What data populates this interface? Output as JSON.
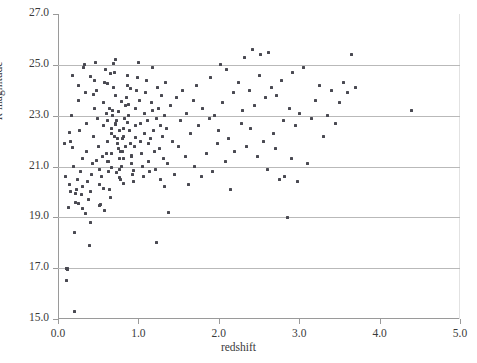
{
  "chart_data": {
    "type": "scatter",
    "title": "",
    "xlabel": "redshift",
    "ylabel": "R magnitude",
    "ylabel_italic_prefix": "R",
    "ylabel_rest": " magnitude",
    "xlim": [
      0.0,
      5.0
    ],
    "ylim": [
      15.0,
      27.0
    ],
    "xticks": [
      "0.0",
      "1.0",
      "2.0",
      "3.0",
      "4.0",
      "5.0"
    ],
    "xtick_values": [
      0.0,
      1.0,
      2.0,
      3.0,
      4.0,
      5.0
    ],
    "yticks": [
      "15.0",
      "17.0",
      "19.0",
      "21.0",
      "23.0",
      "25.0",
      "27.0"
    ],
    "ytick_values": [
      15.0,
      17.0,
      19.0,
      21.0,
      23.0,
      25.0,
      27.0
    ],
    "grid": "horizontal",
    "gridline_color": "#b9b9b9",
    "axis_color": "#9a9a9a",
    "marker_color": "#4a4a52",
    "marker_size_px": 3,
    "legend": null,
    "points": [
      [
        0.08,
        21.9
      ],
      [
        0.09,
        20.6
      ],
      [
        0.1,
        17.0
      ],
      [
        0.11,
        17.0
      ],
      [
        0.12,
        17.0
      ],
      [
        0.12,
        16.95
      ],
      [
        0.1,
        16.5
      ],
      [
        0.13,
        19.4
      ],
      [
        0.14,
        20.3
      ],
      [
        0.15,
        20.0
      ],
      [
        0.16,
        22.0
      ],
      [
        0.17,
        23.0
      ],
      [
        0.18,
        24.6
      ],
      [
        0.19,
        21.0
      ],
      [
        0.2,
        15.3
      ],
      [
        0.21,
        18.4
      ],
      [
        0.22,
        19.6
      ],
      [
        0.23,
        20.1
      ],
      [
        0.24,
        20.5
      ],
      [
        0.25,
        24.2
      ],
      [
        0.26,
        23.6
      ],
      [
        0.27,
        22.4
      ],
      [
        0.28,
        20.8
      ],
      [
        0.29,
        19.9
      ],
      [
        0.3,
        20.2
      ],
      [
        0.31,
        21.3
      ],
      [
        0.32,
        24.9
      ],
      [
        0.33,
        25.0
      ],
      [
        0.34,
        23.9
      ],
      [
        0.35,
        22.7
      ],
      [
        0.36,
        21.6
      ],
      [
        0.37,
        20.4
      ],
      [
        0.38,
        19.7
      ],
      [
        0.39,
        17.9
      ],
      [
        0.4,
        18.8
      ],
      [
        0.41,
        20.0
      ],
      [
        0.42,
        20.7
      ],
      [
        0.43,
        21.1
      ],
      [
        0.44,
        22.2
      ],
      [
        0.45,
        23.3
      ],
      [
        0.46,
        24.4
      ],
      [
        0.47,
        25.1
      ],
      [
        0.48,
        24.0
      ],
      [
        0.49,
        22.9
      ],
      [
        0.5,
        21.8
      ],
      [
        0.51,
        20.9
      ],
      [
        0.52,
        20.3
      ],
      [
        0.53,
        19.5
      ],
      [
        0.54,
        20.6
      ],
      [
        0.55,
        21.4
      ],
      [
        0.56,
        22.6
      ],
      [
        0.57,
        23.5
      ],
      [
        0.58,
        24.3
      ],
      [
        0.59,
        24.8
      ],
      [
        0.6,
        23.1
      ],
      [
        0.61,
        22.0
      ],
      [
        0.62,
        21.2
      ],
      [
        0.63,
        20.8
      ],
      [
        0.64,
        20.1
      ],
      [
        0.65,
        19.8
      ],
      [
        0.66,
        21.5
      ],
      [
        0.67,
        22.3
      ],
      [
        0.68,
        23.2
      ],
      [
        0.69,
        24.1
      ],
      [
        0.7,
        24.7
      ],
      [
        0.71,
        25.2
      ],
      [
        0.72,
        23.8
      ],
      [
        0.73,
        22.8
      ],
      [
        0.74,
        22.1
      ],
      [
        0.75,
        21.7
      ],
      [
        0.76,
        21.3
      ],
      [
        0.77,
        20.9
      ],
      [
        0.78,
        20.5
      ],
      [
        0.79,
        21.0
      ],
      [
        0.8,
        21.6
      ],
      [
        0.81,
        22.2
      ],
      [
        0.82,
        22.5
      ],
      [
        0.83,
        22.9
      ],
      [
        0.84,
        23.4
      ],
      [
        0.85,
        23.7
      ],
      [
        0.86,
        24.2
      ],
      [
        0.87,
        24.6
      ],
      [
        0.88,
        23.0
      ],
      [
        0.89,
        22.4
      ],
      [
        0.9,
        21.9
      ],
      [
        0.91,
        21.4
      ],
      [
        0.92,
        21.1
      ],
      [
        0.93,
        20.7
      ],
      [
        0.94,
        20.4
      ],
      [
        0.95,
        21.8
      ],
      [
        0.96,
        22.6
      ],
      [
        0.97,
        23.3
      ],
      [
        0.98,
        24.0
      ],
      [
        0.99,
        24.5
      ],
      [
        1.0,
        25.1
      ],
      [
        1.01,
        23.6
      ],
      [
        1.02,
        22.7
      ],
      [
        1.03,
        22.0
      ],
      [
        1.04,
        21.5
      ],
      [
        1.05,
        21.0
      ],
      [
        1.06,
        20.6
      ],
      [
        1.07,
        22.3
      ],
      [
        1.08,
        23.1
      ],
      [
        1.09,
        23.9
      ],
      [
        1.1,
        24.4
      ],
      [
        1.11,
        22.8
      ],
      [
        1.12,
        21.9
      ],
      [
        1.13,
        21.2
      ],
      [
        1.14,
        20.8
      ],
      [
        1.15,
        22.1
      ],
      [
        1.16,
        23.5
      ],
      [
        1.17,
        24.9
      ],
      [
        1.18,
        23.2
      ],
      [
        1.19,
        22.4
      ],
      [
        1.2,
        21.6
      ],
      [
        1.21,
        20.9
      ],
      [
        1.22,
        18.0
      ],
      [
        1.23,
        22.9
      ],
      [
        1.24,
        24.1
      ],
      [
        1.25,
        23.3
      ],
      [
        1.26,
        21.7
      ],
      [
        1.27,
        20.5
      ],
      [
        1.28,
        22.6
      ],
      [
        1.29,
        23.8
      ],
      [
        1.3,
        22.2
      ],
      [
        1.31,
        21.3
      ],
      [
        1.32,
        20.2
      ],
      [
        1.33,
        23.0
      ],
      [
        1.34,
        24.3
      ],
      [
        1.35,
        22.5
      ],
      [
        1.36,
        21.1
      ],
      [
        1.37,
        19.2
      ],
      [
        1.4,
        23.4
      ],
      [
        1.42,
        22.0
      ],
      [
        1.45,
        20.7
      ],
      [
        1.48,
        23.7
      ],
      [
        1.5,
        21.8
      ],
      [
        1.52,
        22.8
      ],
      [
        1.55,
        24.0
      ],
      [
        1.58,
        21.4
      ],
      [
        1.6,
        23.1
      ],
      [
        1.62,
        20.3
      ],
      [
        1.65,
        22.3
      ],
      [
        1.68,
        23.6
      ],
      [
        1.7,
        21.0
      ],
      [
        1.72,
        24.2
      ],
      [
        1.75,
        22.6
      ],
      [
        1.78,
        20.6
      ],
      [
        1.8,
        23.3
      ],
      [
        1.85,
        21.5
      ],
      [
        1.88,
        22.9
      ],
      [
        1.9,
        24.5
      ],
      [
        1.92,
        20.8
      ],
      [
        1.95,
        23.0
      ],
      [
        1.98,
        21.9
      ],
      [
        2.0,
        22.4
      ],
      [
        2.02,
        25.0
      ],
      [
        2.05,
        23.5
      ],
      [
        2.08,
        21.2
      ],
      [
        2.1,
        24.8
      ],
      [
        2.12,
        22.1
      ],
      [
        2.15,
        20.1
      ],
      [
        2.18,
        23.9
      ],
      [
        2.2,
        21.6
      ],
      [
        2.25,
        24.3
      ],
      [
        2.28,
        22.7
      ],
      [
        2.3,
        23.2
      ],
      [
        2.32,
        25.3
      ],
      [
        2.35,
        21.8
      ],
      [
        2.38,
        24.0
      ],
      [
        2.4,
        22.5
      ],
      [
        2.42,
        25.6
      ],
      [
        2.45,
        23.4
      ],
      [
        2.48,
        21.4
      ],
      [
        2.5,
        24.6
      ],
      [
        2.52,
        25.4
      ],
      [
        2.55,
        22.0
      ],
      [
        2.58,
        23.7
      ],
      [
        2.6,
        20.9
      ],
      [
        2.62,
        25.5
      ],
      [
        2.65,
        24.1
      ],
      [
        2.68,
        22.3
      ],
      [
        2.7,
        21.7
      ],
      [
        2.72,
        23.8
      ],
      [
        2.75,
        20.5
      ],
      [
        2.78,
        24.4
      ],
      [
        2.8,
        22.8
      ],
      [
        2.82,
        20.6
      ],
      [
        2.85,
        19.0
      ],
      [
        2.88,
        23.3
      ],
      [
        2.9,
        21.3
      ],
      [
        2.92,
        24.7
      ],
      [
        2.95,
        22.6
      ],
      [
        2.98,
        20.4
      ],
      [
        3.0,
        23.1
      ],
      [
        3.05,
        24.9
      ],
      [
        3.1,
        21.1
      ],
      [
        3.15,
        22.9
      ],
      [
        3.2,
        23.6
      ],
      [
        3.25,
        24.2
      ],
      [
        3.3,
        22.2
      ],
      [
        3.35,
        23.0
      ],
      [
        3.4,
        24.0
      ],
      [
        3.45,
        22.7
      ],
      [
        3.5,
        23.5
      ],
      [
        3.55,
        24.3
      ],
      [
        3.6,
        23.9
      ],
      [
        3.65,
        25.4
      ],
      [
        3.7,
        24.1
      ],
      [
        4.4,
        23.2
      ],
      [
        0.62,
        22.8
      ],
      [
        0.66,
        22.5
      ],
      [
        0.7,
        22.2
      ],
      [
        0.74,
        21.9
      ],
      [
        0.78,
        21.6
      ],
      [
        0.82,
        21.3
      ],
      [
        0.64,
        23.3
      ],
      [
        0.68,
        23.0
      ],
      [
        0.72,
        22.7
      ],
      [
        0.76,
        22.4
      ],
      [
        0.8,
        22.1
      ],
      [
        0.84,
        21.8
      ],
      [
        0.6,
        21.5
      ],
      [
        0.63,
        21.2
      ],
      [
        0.67,
        20.95
      ],
      [
        0.71,
        22.65
      ],
      [
        0.75,
        23.15
      ],
      [
        0.79,
        23.55
      ],
      [
        0.61,
        24.25
      ],
      [
        0.65,
        24.65
      ],
      [
        0.69,
        25.05
      ],
      [
        0.73,
        20.75
      ],
      [
        0.77,
        20.55
      ],
      [
        0.81,
        20.35
      ],
      [
        0.86,
        22.75
      ],
      [
        0.88,
        23.45
      ],
      [
        0.9,
        24.05
      ],
      [
        0.92,
        21.45
      ],
      [
        0.94,
        20.85
      ],
      [
        0.96,
        22.15
      ],
      [
        0.4,
        24.55
      ],
      [
        0.44,
        23.85
      ],
      [
        0.48,
        21.25
      ],
      [
        0.52,
        19.45
      ],
      [
        0.56,
        20.15
      ],
      [
        0.58,
        19.25
      ],
      [
        0.3,
        19.35
      ],
      [
        0.34,
        19.15
      ],
      [
        0.26,
        19.55
      ],
      [
        0.22,
        19.95
      ],
      [
        0.18,
        21.75
      ],
      [
        0.14,
        22.35
      ]
    ]
  }
}
